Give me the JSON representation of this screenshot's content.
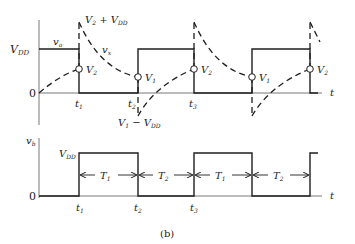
{
  "figure": {
    "caption": "(b)",
    "colors": {
      "ink": "#1e1e1e",
      "background": "#ffffff"
    }
  },
  "top_plot": {
    "y_axis_label_va": "v",
    "y_axis_label_va_sub": "a",
    "curve_label_vx": "v",
    "curve_label_vx_sub": "x",
    "level_vdd": "V",
    "level_vdd_sub": "DD",
    "zero": "0",
    "t_axis": "t",
    "peak_label": {
      "a": "V",
      "a_sub": "2",
      "plus": " + ",
      "b": "V",
      "b_sub": "DD"
    },
    "trough_label": {
      "a": "V",
      "a_sub": "1",
      "minus": " − ",
      "b": "V",
      "b_sub": "DD"
    },
    "markers": [
      {
        "label": "V",
        "sub": "2"
      },
      {
        "label": "V",
        "sub": "1"
      },
      {
        "label": "V",
        "sub": "2"
      },
      {
        "label": "V",
        "sub": "1"
      },
      {
        "label": "V",
        "sub": "2"
      }
    ],
    "time_ticks": [
      {
        "label": "t",
        "sub": "1"
      },
      {
        "label": "t",
        "sub": "2"
      },
      {
        "label": "t",
        "sub": "3"
      }
    ]
  },
  "bottom_plot": {
    "y_axis_label": "v",
    "y_axis_label_sub": "b",
    "level_vdd": "V",
    "level_vdd_sub": "DD",
    "zero": "0",
    "t_axis": "t",
    "intervals": [
      {
        "label": "T",
        "sub": "1"
      },
      {
        "label": "T",
        "sub": "2"
      },
      {
        "label": "T",
        "sub": "1"
      },
      {
        "label": "T",
        "sub": "2"
      }
    ],
    "time_ticks": [
      {
        "label": "t",
        "sub": "1"
      },
      {
        "label": "t",
        "sub": "2"
      },
      {
        "label": "t",
        "sub": "3"
      }
    ]
  }
}
